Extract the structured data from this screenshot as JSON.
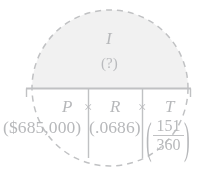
{
  "figure": {
    "type": "formula-diagram",
    "topic": "simple-interest-formula",
    "highlight": {
      "shape": "dashed-circle",
      "fill_color": "#e9e9e9",
      "stroke_color": "#9a9c9f",
      "stroke_style": "dashed",
      "center_x": 110,
      "center_y": 88,
      "radius": 78
    },
    "ink_color": "#8b8d91",
    "rule_color": "#9a9c9f"
  },
  "result": {
    "symbol": "I",
    "value": "(?)"
  },
  "formula": {
    "terms": [
      {
        "symbol": "P",
        "value": "($685,000)"
      },
      {
        "symbol": "R",
        "value": "(.0686)"
      },
      {
        "symbol": "T",
        "value_numerator": "151",
        "value_denominator": "360"
      }
    ],
    "operator": "×",
    "operator_1": "×",
    "operator_2": "×",
    "left_paren": "(",
    "right_paren": ")"
  },
  "labels": {
    "result_symbol": "I",
    "result_value": "(?)",
    "p_symbol": "P",
    "p_value": "($685,000)",
    "r_symbol": "R",
    "r_value": "(.0686)",
    "t_symbol": "T",
    "t_numerator": "151",
    "t_denominator": "360",
    "times_1": "×",
    "times_2": "×",
    "open_paren": "(",
    "close_paren": ")"
  }
}
